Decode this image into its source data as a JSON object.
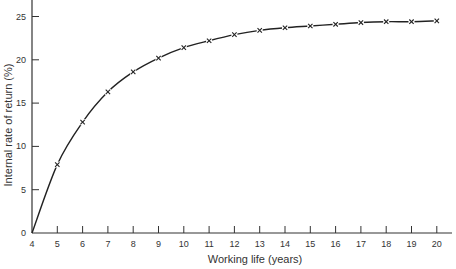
{
  "chart_data": {
    "type": "line",
    "title": "",
    "xlabel": "Working life (years)",
    "ylabel": "Internal rate of return (%)",
    "xlim": [
      4,
      20
    ],
    "ylim": [
      0,
      27
    ],
    "x_ticks": [
      4,
      5,
      6,
      7,
      8,
      9,
      10,
      11,
      12,
      13,
      14,
      15,
      16,
      17,
      18,
      19,
      20
    ],
    "y_ticks": [
      0,
      5,
      10,
      15,
      20,
      25
    ],
    "grid": false,
    "legend": null,
    "series": [
      {
        "name": "IRR",
        "marker": "x",
        "x": [
          4,
          5,
          6,
          7,
          8,
          9,
          10,
          11,
          12,
          13,
          14,
          15,
          16,
          17,
          18,
          19,
          20
        ],
        "values": [
          0,
          7.9,
          12.8,
          16.3,
          18.6,
          20.2,
          21.4,
          22.2,
          22.9,
          23.4,
          23.7,
          23.9,
          24.1,
          24.3,
          24.4,
          24.4,
          24.5
        ],
        "marked_points_start_index": 1
      }
    ]
  },
  "style": {
    "line_color": "#222222",
    "axis_color": "#333333"
  }
}
